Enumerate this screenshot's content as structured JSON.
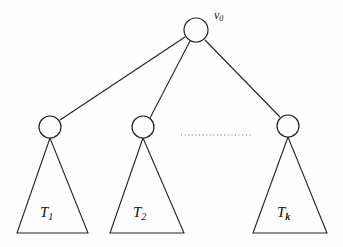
{
  "figure": {
    "background_color": "#fefefe",
    "stroke_color": "#222222",
    "dotted_color": "#9a9a9a"
  },
  "root": {
    "node_name": "root-node",
    "label_base": "v",
    "label_sub": "0",
    "cx": 196,
    "cy": 30,
    "r": 12
  },
  "children": [
    {
      "node_name": "child-node-1",
      "cx": 50,
      "cy": 127,
      "r": 11,
      "subtree_label_base": "T",
      "subtree_label_sub": "1",
      "triangle_apex_x": 50,
      "triangle_apex_y": 138,
      "triangle_base_left_x": 17,
      "triangle_base_right_x": 88,
      "triangle_base_y": 233
    },
    {
      "node_name": "child-node-2",
      "cx": 143,
      "cy": 127,
      "r": 11,
      "subtree_label_base": "T",
      "subtree_label_sub": "2",
      "triangle_apex_x": 143,
      "triangle_apex_y": 138,
      "triangle_base_left_x": 110,
      "triangle_base_right_x": 184,
      "triangle_base_y": 233
    },
    {
      "node_name": "child-node-k",
      "cx": 288,
      "cy": 126,
      "r": 11,
      "subtree_label_base": "T",
      "subtree_label_sub": "k",
      "triangle_apex_x": 288,
      "triangle_apex_y": 137,
      "triangle_base_left_x": 253,
      "triangle_base_right_x": 327,
      "triangle_base_y": 233
    }
  ],
  "ellipsis": {
    "name": "dotted-ellipsis",
    "x1": 181,
    "x2": 252,
    "y": 135
  }
}
